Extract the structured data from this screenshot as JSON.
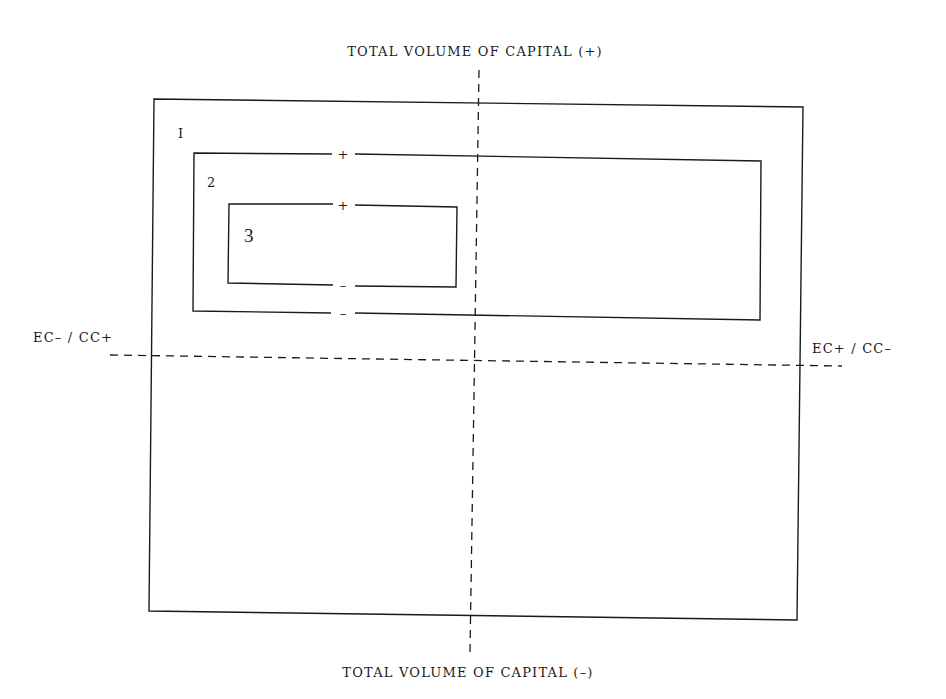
{
  "diagram": {
    "axes": {
      "top_label": "TOTAL VOLUME OF CAPITAL (+)",
      "bottom_label": "TOTAL VOLUME OF CAPITAL (–)",
      "left_label": "EC– / CC+",
      "right_label": "EC+ / CC–"
    },
    "boxes": [
      {
        "id": "1",
        "label": "I"
      },
      {
        "id": "2",
        "label": "2",
        "top_sign": "+",
        "bottom_sign": "–"
      },
      {
        "id": "3",
        "label": "3",
        "top_sign": "+",
        "bottom_sign": "–"
      }
    ],
    "colors": {
      "ink": "#1a1a1a",
      "background": "#ffffff"
    }
  }
}
